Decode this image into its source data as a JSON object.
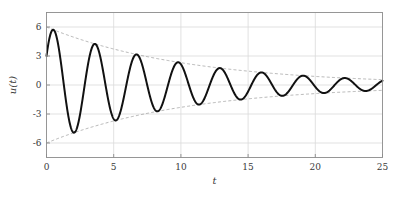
{
  "chart_data": {
    "type": "line",
    "title": "",
    "xlabel": "t",
    "ylabel": "u(t)",
    "xlim": [
      0,
      25
    ],
    "ylim": [
      -7.5,
      7.5
    ],
    "grid": true,
    "legend": null,
    "x_ticks": [
      0,
      5,
      10,
      15,
      20,
      25
    ],
    "x_tick_labels": [
      "0",
      "5",
      "10",
      "15",
      "20",
      "25"
    ],
    "y_ticks": [
      6,
      3,
      0,
      -3,
      -6
    ],
    "y_tick_labels": [
      "6",
      "3",
      "0",
      "-3",
      "-6"
    ],
    "series": [
      {
        "name": "u(t)",
        "style": "solid",
        "color": "#111111",
        "width": 2,
        "model": "damped_sine",
        "amplitude": 6.0,
        "decay_rate": 0.0955,
        "period": 3.1,
        "phase_deg": 30,
        "u_at_0": 3.0,
        "samples": 1400,
        "key_points": [
          {
            "t": 0.0,
            "u": 3.0
          },
          {
            "t": 0.62,
            "u": 5.68
          },
          {
            "t": 2.17,
            "u": -4.88
          },
          {
            "t": 3.72,
            "u": 4.05
          },
          {
            "t": 5.27,
            "u": -3.47
          },
          {
            "t": 6.82,
            "u": 2.92
          },
          {
            "t": 8.37,
            "u": -2.53
          },
          {
            "t": 9.92,
            "u": 2.06
          },
          {
            "t": 11.47,
            "u": -1.82
          },
          {
            "t": 13.02,
            "u": 1.52
          },
          {
            "t": 14.57,
            "u": -1.32
          },
          {
            "t": 16.12,
            "u": 1.12
          },
          {
            "t": 17.67,
            "u": -0.97
          },
          {
            "t": 19.22,
            "u": 0.83
          },
          {
            "t": 20.77,
            "u": -0.72
          },
          {
            "t": 22.32,
            "u": 0.62
          },
          {
            "t": 23.87,
            "u": -0.54
          },
          {
            "t": 25.0,
            "u": -0.1
          }
        ]
      },
      {
        "name": "upper envelope",
        "style": "dashed",
        "color": "#9a9a9a",
        "width": 0.7,
        "model": "exponential",
        "amplitude": 6.0,
        "decay_rate": 0.0955,
        "sign": 1,
        "endpoints": [
          {
            "t": 0,
            "u": 6.0
          },
          {
            "t": 25,
            "u": 0.55
          }
        ]
      },
      {
        "name": "lower envelope",
        "style": "dashed",
        "color": "#9a9a9a",
        "width": 0.7,
        "model": "exponential",
        "amplitude": 6.0,
        "decay_rate": 0.0955,
        "sign": -1,
        "endpoints": [
          {
            "t": 0,
            "u": -6.0
          },
          {
            "t": 25,
            "u": -0.55
          }
        ]
      }
    ]
  },
  "figure": {
    "background": "#ffffff",
    "axes_color": "#8c8c8c",
    "grid_color": "#d9d9d9",
    "text_color": "#3a3a3a"
  }
}
